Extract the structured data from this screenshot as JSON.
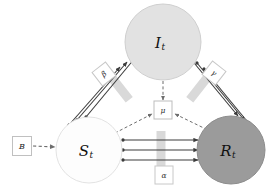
{
  "diagram": {
    "type": "compartmental-flow-diagram",
    "background": "#ffffff",
    "nodes": [
      {
        "id": "I",
        "label": "I",
        "subscript": "t",
        "shape": "circle",
        "cx": 163,
        "cy": 42,
        "r": 38,
        "fill": "#e2e2e2",
        "stroke": "#cfcfcf"
      },
      {
        "id": "S",
        "label": "S",
        "subscript": "t",
        "shape": "circle",
        "cx": 89,
        "cy": 150,
        "r": 33,
        "fill": "#fdfdfd",
        "stroke": "#e3e3e3"
      },
      {
        "id": "R",
        "label": "R",
        "subscript": "t",
        "shape": "circle",
        "cx": 231,
        "cy": 150,
        "r": 34,
        "fill": "#9b9b9b",
        "stroke": "#8d8d8d"
      }
    ],
    "parameter_boxes": [
      {
        "id": "beta",
        "label": "β",
        "shape": "diamond",
        "cx": 104,
        "cy": 74,
        "size": 17,
        "rotation": -38,
        "fill": "#ffffff",
        "stroke": "#c8c8c8"
      },
      {
        "id": "gamma",
        "label": "γ",
        "shape": "diamond",
        "cx": 214,
        "cy": 73,
        "size": 17,
        "rotation": 38,
        "fill": "#ffffff",
        "stroke": "#c8c8c8"
      },
      {
        "id": "mu",
        "label": "μ",
        "shape": "square",
        "cx": 163,
        "cy": 110,
        "size": 18,
        "fill": "#ffffff",
        "stroke": "#bdbdbd"
      },
      {
        "id": "alpha",
        "label": "α",
        "shape": "square",
        "cx": 164,
        "cy": 175,
        "size": 18,
        "fill": "#ffffff",
        "stroke": "#c8c8c8"
      },
      {
        "id": "B",
        "label": "B",
        "shape": "square",
        "cx": 22,
        "cy": 146,
        "size": 19,
        "fill": "#ffffff",
        "stroke": "#c0c0c0"
      }
    ],
    "edges": [
      {
        "id": "S-to-I",
        "from": "S",
        "to": "I",
        "style": "solid",
        "multiplicity": 3,
        "label": "β"
      },
      {
        "id": "I-to-R",
        "from": "I",
        "to": "R",
        "style": "solid",
        "multiplicity": 3,
        "label": "γ"
      },
      {
        "id": "S-to-R",
        "from": "S",
        "to": "R",
        "style": "solid",
        "multiplicity": 3,
        "label": "α"
      },
      {
        "id": "S-to-mu",
        "from": "S",
        "to": "mu",
        "style": "dashed",
        "multiplicity": 1
      },
      {
        "id": "I-to-mu",
        "from": "I",
        "to": "mu",
        "style": "dashed",
        "multiplicity": 1
      },
      {
        "id": "R-to-mu",
        "from": "R",
        "to": "mu",
        "style": "dashed",
        "multiplicity": 1
      },
      {
        "id": "B-to-S",
        "from": "B",
        "to": "S",
        "style": "dashed",
        "multiplicity": 1
      }
    ],
    "gates": [
      {
        "id": "gate-S-I",
        "cx": 120,
        "cy": 88,
        "w": 9,
        "h": 30,
        "rotation": -38,
        "fill": "#d9d9d9"
      },
      {
        "id": "gate-I-R",
        "cx": 199,
        "cy": 88,
        "w": 9,
        "h": 30,
        "rotation": 38,
        "fill": "#d9d9d9"
      },
      {
        "id": "gate-S-R",
        "cx": 161,
        "cy": 150,
        "w": 9,
        "h": 38,
        "rotation": 0,
        "fill": "#d9d9d9"
      }
    ],
    "colors": {
      "edge_solid": "#3c3c3c",
      "edge_dashed": "#6d6d6d",
      "node_infected": "#e2e2e2",
      "node_susceptible": "#fdfdfd",
      "node_recovered": "#9b9b9b",
      "gate": "#d9d9d9",
      "background": "#ffffff"
    }
  }
}
